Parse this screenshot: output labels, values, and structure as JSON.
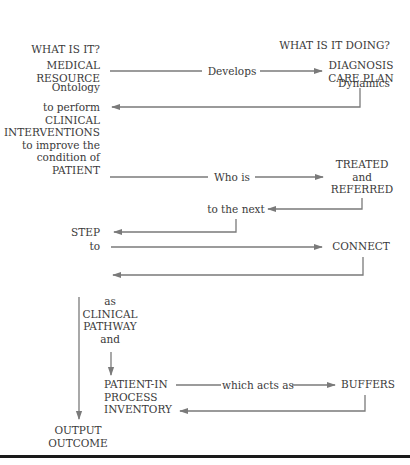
{
  "headers": {
    "left_title": "WHAT IS IT?",
    "left_subtitle": "Ontology",
    "right_title": "WHAT IS IT DOING?",
    "right_subtitle": "Dynamics"
  },
  "nodes": {
    "medical_resource": "MEDICAL\nRESOURCE",
    "diagnosis_care_plan": "DIAGNOSIS\nCARE PLAN",
    "clinical_interventions": "to perform\nCLINICAL\nINTERVENTIONS\nto improve the\ncondition of\nPATIENT",
    "treated_referred": "TREATED\nand\nREFERRED",
    "step": "STEP",
    "to": "to",
    "connect": "CONNECT",
    "clinical_pathway": "as\nCLINICAL\nPATHWAY\nand",
    "patient_in_process_inventory": "PATIENT-IN\nPROCESS\nINVENTORY",
    "buffers": "BUFFERS",
    "output_outcome": "OUTPUT\nOUTCOME"
  },
  "edge_labels": {
    "develops": "Develops",
    "who_is": "Who is",
    "to_the_next": "to the next",
    "which_acts_as": "which acts as"
  }
}
